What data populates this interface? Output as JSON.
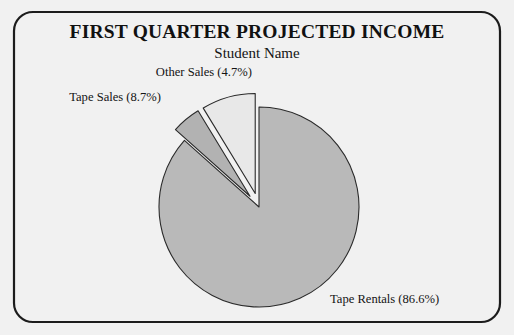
{
  "page": {
    "background_color": "#f1f1f1",
    "frame": {
      "name": "rounded-border-frame",
      "stroke_color": "#1c1c1c",
      "x": 14,
      "y": 12,
      "width": 486,
      "height": 310,
      "corner_radius": 19
    }
  },
  "header": {
    "title": "FIRST QUARTER PROJECTED INCOME",
    "subtitle": "Student Name"
  },
  "chart_data": {
    "type": "pie",
    "title": "FIRST QUARTER PROJECTED INCOME",
    "subtitle": "Student Name",
    "xlabel": "",
    "ylabel": "",
    "legend_position": "none",
    "grid": false,
    "labels_show_percent": true,
    "start_angle_deg": 0,
    "direction": "clockwise",
    "center": {
      "x": 259,
      "y": 207
    },
    "radius": 100,
    "categories": [
      "Tape Rentals",
      "Other Sales",
      "Tape Sales"
    ],
    "values": [
      86.6,
      4.7,
      8.7
    ],
    "units": "percent",
    "slices": [
      {
        "name": "Tape Rentals",
        "value": 86.6,
        "label": "Tape Rentals (86.6%)",
        "color": "#b9b9b9",
        "exploded": false,
        "explode_offset": 0,
        "start_deg": 0,
        "end_deg": 311.76,
        "label_x": 330,
        "label_y": 303,
        "label_anchor": "start"
      },
      {
        "name": "Other Sales",
        "value": 4.7,
        "label": "Other Sales (4.7%)",
        "color": "#b2b2b2",
        "exploded": true,
        "explode_offset": 14,
        "start_deg": 311.76,
        "end_deg": 328.68,
        "label_x": 252,
        "label_y": 76,
        "label_anchor": "end"
      },
      {
        "name": "Tape Sales",
        "value": 8.7,
        "label": "Tape Sales (8.7%)",
        "color": "#e8e8e8",
        "exploded": true,
        "explode_offset": 14,
        "start_deg": 328.68,
        "end_deg": 360.0,
        "label_x": 161,
        "label_y": 101,
        "label_anchor": "end"
      }
    ]
  }
}
